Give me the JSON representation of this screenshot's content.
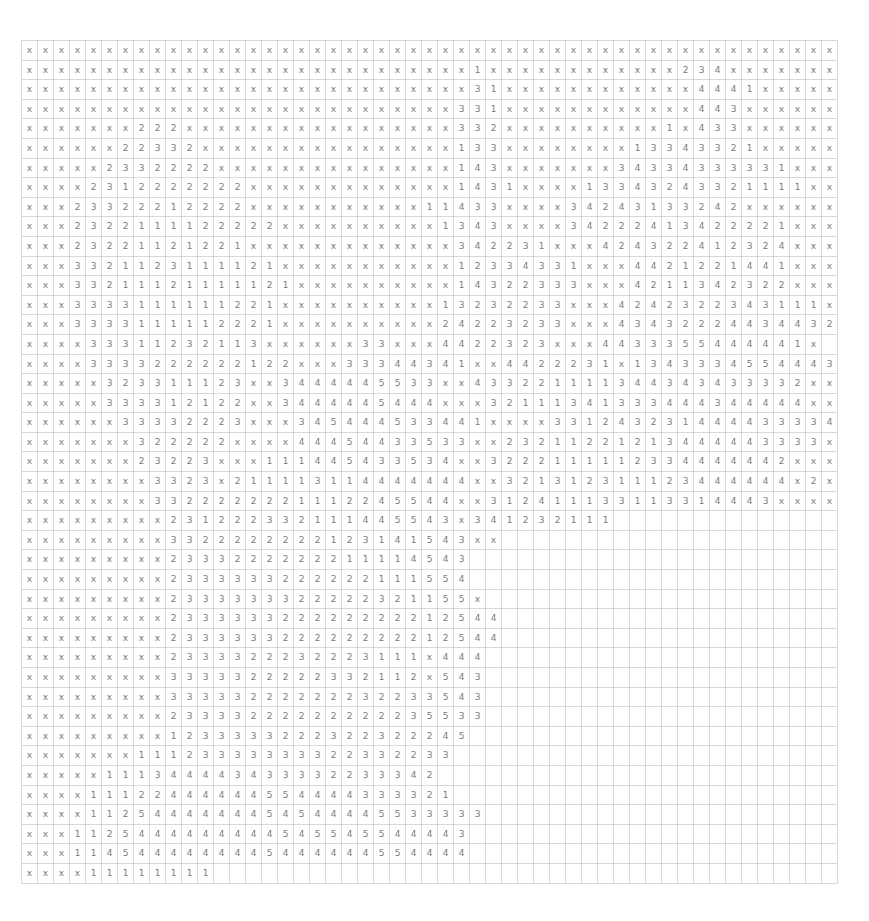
{
  "grid": {
    "columns": 51,
    "rows": [
      "xxxxxxxxxxxxxxxxxxxxxxxxxxxxxxxxxxxxxxxxxxxxxxxxxxx",
      "xxxxxxxxxxxxxxxxxxxxxxxxxxxx1xxxxxxxxxxxx234xxxxxxxx",
      "xxxxxxxxxxxxxxxxxxxxxxxxxxxx31xxxxxxxxxxxx4441xxxxxxx",
      "xxxxxxxxxxxxxxxxxxxxxxxxxxx331xxxxxxxxxxxx443xxxxxxxx",
      "xxxxxxx222xxxxxxxxxxxxxxxxx332xxxxxxxxxx1x433xxxxxxxx",
      "xxxxxx22332xxxxxxxxxxxxxxxx133xxxxxxxx13343321xxxxxxx",
      "xxxxx2332222xxxxxxxxxxxxxxx143xxxxxxx34334333331xxxxx",
      "xxxx2312222222xxxxxxxxxxxxx1431xxxx13343243321111xxxx",
      "xxx23322212222xxxxxxxxxxx11433xxxx34243133242xxxxxxx",
      "xxx2322111122222xxxxxxxxxx1343xxxx34222413422221xxxx",
      "xxx23221121221xxxxxxxxxxxxx342231xxx42432241232 4xxxxx",
      "xxx3321123111121xxxxxxxxxxx12334331xxx4421221441xxxxx",
      "xxx33211121111121xxxxxxxxxx14322333xxx421134232 2xxxxx",
      "xxx3333111111221xxxxxxxxxx1323223 3xxx424232234311 1xx",
      "xxx3333111112221xxxxxxxxxx2422323 3xxx434322244344 32x",
      "xxxx333112321 13xxxxxx33xxx4422323xxx4433355444441x",
      "xxxx3333222222122xxx33344341xx44222 31x134333455444342 11",
      "xxxxx32331112 3xx344444553 3xx4332211113443 4343333 2xx",
      "xxxxx33331212 2xx344444544 4xxx32111341 3334443444 44xx",
      "xxxxxx33332223xxx345444533 441xxxx3312 43231444433334 3xx",
      "xxxxxxx322222xxxx444544335 3 3xx23211221213444443333xxx",
      "xxxxxxx2322 3xxx11144543353 4xx 3222111112334444442xxxx",
      "xxxxxxxx3323x21111 3114444444xx3213123111 2344444 4x2xx",
      "xxxxxxxx332222222111224554 4xx3124111331133 1 4443xxxx",
      "xxxxxxxxx231 2 2 2 3 3 2 1 1 1 4 4 5 5 4 3 x 3 4 1 2 3 2 1 1 1",
      "xxxxxxxxx3322222222 1 2 3 1 4 1 5 4 3 x x",
      "xxxxxxxxx2333222222 2 1 1 1 1 4 5 4 3",
      "xxxxxxxxx2333333222 2 2 2 1 1 1 5 5 4",
      "xxxxxxxxx2333333322222 3 2 1 1 5 5 x",
      "xxxxxxxxx2333333222222222 1 2 5 4 4",
      "xxxxxxxxx2333333222222222 1 2 5 4 4",
      "xxxxxxxxx2333322232223 1 1 1 x 4 4 4",
      "xxxxxxxxx3333322222332 1 1 2 x 5 4 3",
      "xxxxxxxxx3333322222223 2 2 3 3 5 4 3",
      "xxxxxxxxx2333322222222 2 2 3 5 5 3 3",
      "xxxxxxxxx1 2 3 3 3 3 3 2 2 2 3 2 2 3 2 2 2 4 5",
      "xxxxxxx11 1 2 3 3 3 3 3 3 3 3 2 2 3 3 2 2 3 3",
      "xxxxx11 1 3 4 4 4 4 3 4 3 3 3 3 2 2 3 3 3 4 2",
      "xxxx11122444444554444333321",
      "xxxx1125444444454544445533333",
      "xxx1125444444444545545544443",
      "xxx1145444444445444444554444",
      "xxxx11 1 1 1 1 1 1"
    ]
  }
}
